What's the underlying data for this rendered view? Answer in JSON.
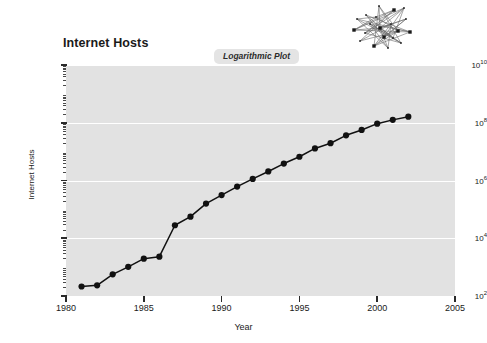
{
  "chart_data": {
    "type": "line",
    "title": "Internet Hosts",
    "subtitle": "Logarithmic Plot",
    "xlabel": "Year",
    "ylabel": "Internet Hosts",
    "yscale": "log",
    "xlim": [
      1980,
      2005
    ],
    "ylim": [
      100,
      10000000000
    ],
    "grid": "horizontal",
    "legend": "none",
    "marker": "filled-circle",
    "line_color": "#111111",
    "marker_color": "#111111",
    "panel_color": "#e2e2e2",
    "gridline_color": "#ffffff",
    "x": [
      1981,
      1982,
      1983,
      1984,
      1985,
      1986,
      1987,
      1988,
      1989,
      1990,
      1991,
      1992,
      1993,
      1994,
      1995,
      1996,
      1997,
      1998,
      1999,
      2000,
      2001,
      2002
    ],
    "values": [
      213,
      235,
      562,
      1024,
      1961,
      2308,
      28174,
      56000,
      159000,
      313000,
      617000,
      1136000,
      2056000,
      3864000,
      6642000,
      12881000,
      19540000,
      36739000,
      56218000,
      93047000,
      125888000,
      162128000
    ],
    "xticks": [
      1980,
      1985,
      1990,
      1995,
      2000,
      2005
    ],
    "xtick_labels": [
      "1980",
      "1985",
      "1990",
      "1995",
      "2000",
      "2005"
    ],
    "yticks": [
      100,
      10000,
      1000000,
      100000000,
      10000000000
    ],
    "ytick_labels": [
      "10",
      "10",
      "10",
      "10",
      "10"
    ],
    "ytick_exponents": [
      "2",
      "4",
      "6",
      "8",
      "10"
    ]
  },
  "decoration": {
    "network_graphic_name": "network-mesh-graphic"
  }
}
